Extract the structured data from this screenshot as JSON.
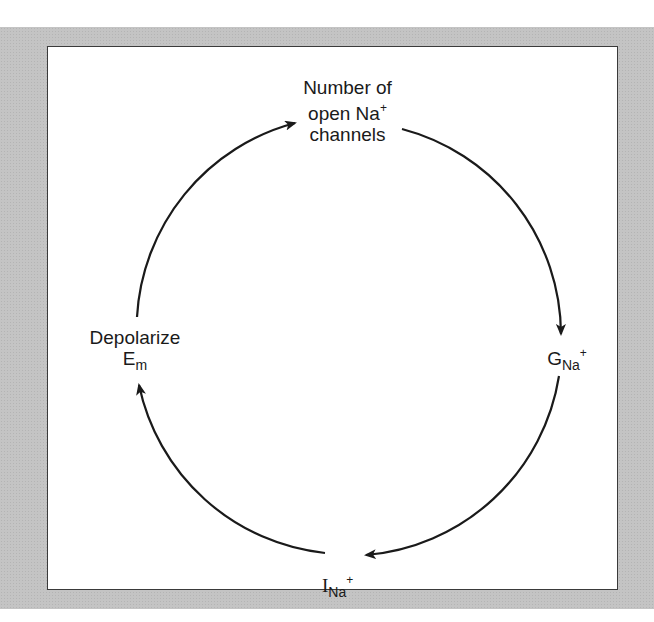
{
  "diagram": {
    "type": "cycle",
    "nodes": [
      {
        "id": "open_channels",
        "line1": "Number of",
        "line2_main": "open Na",
        "line2_sup": "+",
        "line3": "channels"
      },
      {
        "id": "g_na",
        "main": "G",
        "sub": "Na",
        "sup": "+"
      },
      {
        "id": "i_na",
        "main": "I",
        "sub": "Na",
        "sup": "+"
      },
      {
        "id": "depolarize",
        "line1": "Depolarize",
        "main": "E",
        "sub": "m"
      }
    ],
    "edges": [
      {
        "from": "depolarize",
        "to": "open_channels"
      },
      {
        "from": "open_channels",
        "to": "g_na"
      },
      {
        "from": "g_na",
        "to": "i_na"
      },
      {
        "from": "i_na",
        "to": "depolarize"
      }
    ],
    "colors": {
      "frame": "#c4c4c4",
      "panel": "#ffffff",
      "ink": "#1a1a1a"
    }
  }
}
